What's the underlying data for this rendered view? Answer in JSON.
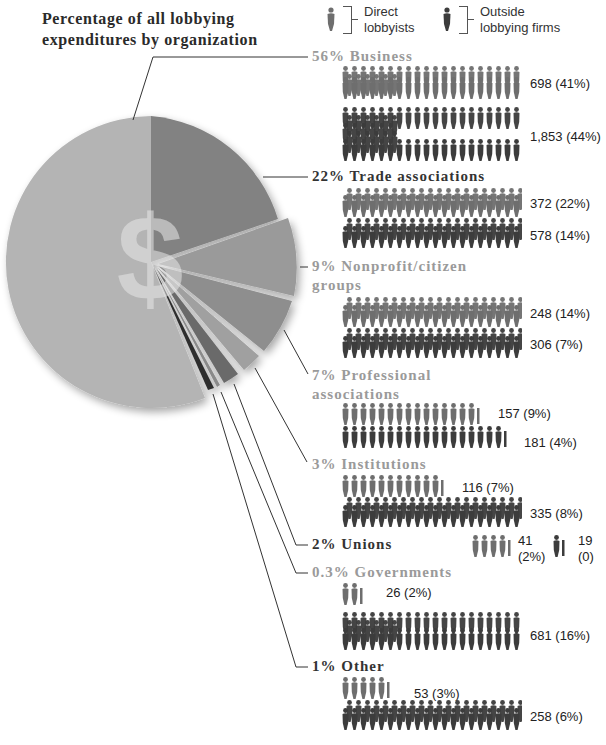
{
  "title_line1": "Percentage of all lobbying",
  "title_line2": "expenditures by organization",
  "legend": {
    "direct": {
      "line1": "Direct",
      "line2": "lobbyists",
      "icon": "person-icon-light",
      "color": "#6e6e6e"
    },
    "outside": {
      "line1": "Outside",
      "line2": "lobbying firms",
      "icon": "person-icon-dark",
      "color": "#3c3c3c"
    }
  },
  "colors": {
    "direct": "#6e6e6e",
    "outside": "#3c3c3c",
    "heading_dark": "#333333",
    "heading_light": "#9a9a9a"
  },
  "categories": [
    {
      "heading": "56% Business",
      "direct_label": "698 (41%)",
      "outside_label": "1,853 (44%)"
    },
    {
      "heading": "22% Trade associations",
      "direct_label": "372 (22%)",
      "outside_label": "578 (14%)"
    },
    {
      "heading_line1": "9% Nonprofit/citizen",
      "heading_line2": "groups",
      "direct_label": "248 (14%)",
      "outside_label": "306 (7%)"
    },
    {
      "heading_line1": "7% Professional",
      "heading_line2": "associations",
      "direct_label": "157 (9%)",
      "outside_label": "181 (4%)"
    },
    {
      "heading": "3% Institutions",
      "direct_label": "116 (7%)",
      "outside_label": "335 (8%)"
    },
    {
      "heading": "2% Unions",
      "direct_count": "41",
      "direct_pct": "(2%)",
      "outside_count": "19",
      "outside_pct": "(0)"
    },
    {
      "heading": "0.3% Governments",
      "direct_label": "26 (2%)",
      "outside_label": "681 (16%)"
    },
    {
      "heading": "1% Other",
      "direct_label": "53 (3%)",
      "outside_label": "258 (6%)"
    }
  ],
  "chart_data": [
    {
      "type": "pie",
      "title": "Percentage of all lobbying expenditures by organization",
      "categories": [
        "Business",
        "Trade associations",
        "Nonprofit/citizen groups",
        "Professional associations",
        "Institutions",
        "Unions",
        "Governments",
        "Other"
      ],
      "values": [
        56,
        22,
        9,
        7,
        3,
        2,
        0.3,
        1
      ],
      "unit": "%",
      "center_symbol": "$"
    },
    {
      "type": "bar",
      "title": "Lobbyists by organization type (pictogram)",
      "categories": [
        "Business",
        "Trade associations",
        "Nonprofit/citizen groups",
        "Professional associations",
        "Institutions",
        "Unions",
        "Governments",
        "Other"
      ],
      "series": [
        {
          "name": "Direct lobbyists",
          "values": [
            698,
            372,
            248,
            157,
            116,
            41,
            26,
            53
          ],
          "percent": [
            "41%",
            "22%",
            "14%",
            "9%",
            "7%",
            "2%",
            "2%",
            "3%"
          ]
        },
        {
          "name": "Outside lobbying firms",
          "values": [
            1853,
            578,
            306,
            181,
            335,
            19,
            681,
            258
          ],
          "percent": [
            "44%",
            "14%",
            "7%",
            "4%",
            "8%",
            "0",
            "16%",
            "6%"
          ]
        }
      ],
      "legend": [
        "Direct lobbyists",
        "Outside lobbying firms"
      ],
      "legend_position": "top"
    }
  ]
}
